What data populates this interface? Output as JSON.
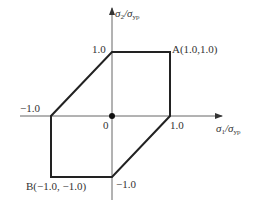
{
  "diagram": {
    "axes": {
      "x_label_main": "σ",
      "x_label_sub1": "1",
      "x_label_slash": "/σ",
      "x_label_sub2": "yp",
      "y_label_main": "σ",
      "y_label_sub1": "2",
      "y_label_slash": "/σ",
      "y_label_sub2": "yp",
      "origin": "0"
    },
    "ticks": {
      "y_pos": "1.0",
      "y_neg": "−1.0",
      "x_pos": "1.0",
      "x_neg": "−1.0"
    },
    "points": {
      "A": "A(1.0,1.0)",
      "B": "B(−1.0, −1.0)"
    },
    "vertices": [
      [
        0,
        1
      ],
      [
        1,
        1
      ],
      [
        1,
        0
      ],
      [
        0,
        -1
      ],
      [
        -1,
        -1
      ],
      [
        -1,
        0
      ]
    ],
    "colors": {
      "line": "#222222",
      "axis": "#555555"
    }
  }
}
